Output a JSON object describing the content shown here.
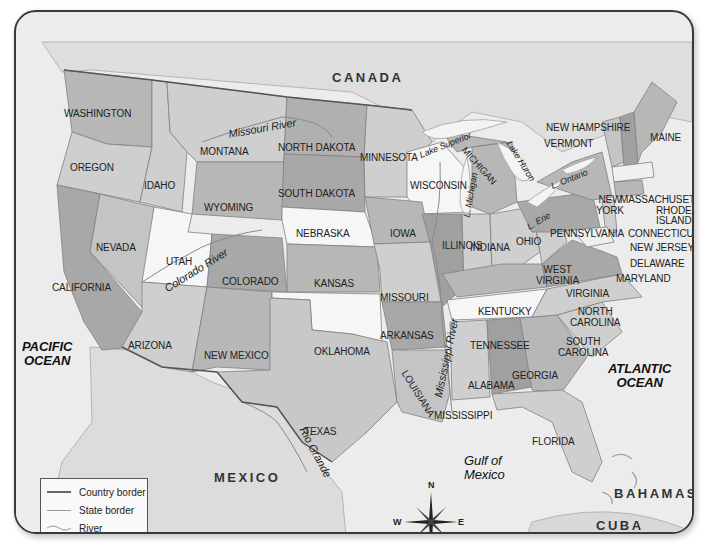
{
  "title": "United States",
  "colors": {
    "title_bar": "#3c3c3c",
    "title_text": "#f4f4f4",
    "ocean": "#ececec",
    "land_foreign": "#dcdcdc",
    "state_white": "#f6f6f6",
    "state_light": "#cfcfcf",
    "state_medium": "#b7b7b7",
    "state_dark": "#9e9e9e",
    "country_border": "#555555",
    "state_border": "#808080",
    "river": "#8a8a8a"
  },
  "countries": [
    {
      "name": "CANADA"
    },
    {
      "name": "MEXICO"
    },
    {
      "name": "BAHAMAS"
    },
    {
      "name": "CUBA"
    }
  ],
  "water_bodies": {
    "pacific": {
      "line1": "PACIFIC",
      "line2": "OCEAN"
    },
    "atlantic": {
      "line1": "ATLANTIC",
      "line2": "OCEAN"
    },
    "gulf": {
      "line1": "Gulf of",
      "line2": "Mexico"
    }
  },
  "lakes": [
    {
      "name": "Lake Superior"
    },
    {
      "name": "L. Michigan"
    },
    {
      "name": "Lake Huron"
    },
    {
      "name": "L. Ontario"
    },
    {
      "name": "L. Erie"
    }
  ],
  "rivers": [
    {
      "name": "Missouri River"
    },
    {
      "name": "Colorado River"
    },
    {
      "name": "Mississippi River"
    },
    {
      "name": "Rio Grande"
    }
  ],
  "states": {
    "washington": "WASHINGTON",
    "oregon": "OREGON",
    "california": "CALIFORNIA",
    "nevada": "NEVADA",
    "idaho": "IDAHO",
    "montana": "MONTANA",
    "wyoming": "WYOMING",
    "utah": "UTAH",
    "arizona": "ARIZONA",
    "colorado": "COLORADO",
    "new_mexico": "NEW MEXICO",
    "north_dakota": "NORTH DAKOTA",
    "south_dakota": "SOUTH DAKOTA",
    "nebraska": "NEBRASKA",
    "kansas": "KANSAS",
    "oklahoma": "OKLAHOMA",
    "texas": "TEXAS",
    "minnesota": "MINNESOTA",
    "iowa": "IOWA",
    "missouri": "MISSOURI",
    "arkansas": "ARKANSAS",
    "louisiana": "LOUISIANA",
    "wisconsin": "WISCONSIN",
    "illinois": "ILLINOIS",
    "michigan": "MICHIGAN",
    "indiana": "INDIANA",
    "ohio": "OHIO",
    "kentucky": "KENTUCKY",
    "tennessee": "TENNESSEE",
    "mississippi": "MISSISSIPPI",
    "alabama": "ALABAMA",
    "georgia": "GEORGIA",
    "florida": "FLORIDA",
    "south_carolina_1": "SOUTH",
    "south_carolina_2": "CAROLINA",
    "north_carolina_1": "NORTH",
    "north_carolina_2": "CAROLINA",
    "virginia": "VIRGINIA",
    "west_virginia_1": "WEST",
    "west_virginia_2": "VIRGINIA",
    "pennsylvania": "PENNSYLVANIA",
    "new_york_1": "NEW",
    "new_york_2": "YORK",
    "maine": "MAINE",
    "new_hampshire": "NEW HAMPSHIRE",
    "vermont": "VERMONT",
    "massachusetts": "MASSACHUSETTS",
    "rhode_island_1": "RHODE",
    "rhode_island_2": "ISLAND",
    "connecticut": "CONNECTICUT",
    "new_jersey": "NEW JERSEY",
    "delaware": "DELAWARE",
    "maryland": "MARYLAND"
  },
  "legend": {
    "items": [
      {
        "label": "Country border",
        "style": "country-border"
      },
      {
        "label": "State border",
        "style": "state-border"
      },
      {
        "label": "River",
        "style": "river"
      }
    ]
  },
  "compass": {
    "n": "N",
    "s": "S",
    "e": "E",
    "w": "W"
  }
}
